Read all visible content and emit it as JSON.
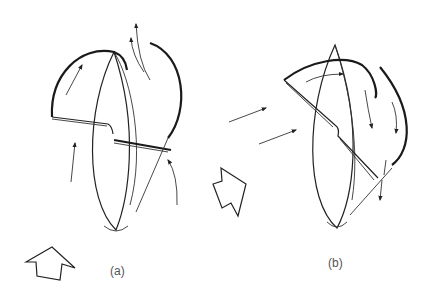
{
  "figure": {
    "panels": [
      {
        "id": "a",
        "label": "(a)",
        "label_pos": [
          110,
          266
        ]
      },
      {
        "id": "b",
        "label": "(b)",
        "label_pos": [
          328,
          258
        ]
      }
    ],
    "colors": {
      "ink": "#222222",
      "background": "#ffffff"
    },
    "icons": {
      "wind_arrow_a": "hollow-block-arrow-up",
      "wind_arrow_b": "hollow-block-arrow-upright",
      "flow_arrows": "thin-line-arrows"
    }
  }
}
